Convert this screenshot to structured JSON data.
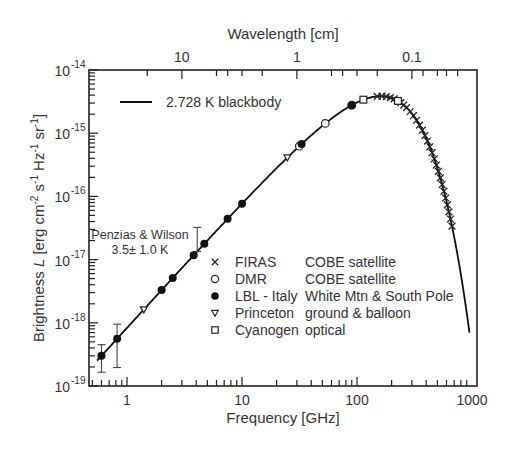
{
  "chart_data": {
    "type": "scatter",
    "title": "",
    "xlabel": "Frequency [GHz]",
    "x2label": "Wavelength [cm]",
    "ylabel": "Brightness L [erg cm^-2 s^-1 Hz^-1 sr^-1]",
    "xscale": "log",
    "yscale": "log",
    "xlim": [
      0.5,
      1000
    ],
    "ylim": [
      1e-19,
      1e-14
    ],
    "x_ticks": [
      {
        "value": 1,
        "label": "1"
      },
      {
        "value": 10,
        "label": "10"
      },
      {
        "value": 100,
        "label": "100"
      },
      {
        "value": 1000,
        "label": "1000"
      }
    ],
    "x2_ticks": [
      {
        "value_cm": 10,
        "label": "10"
      },
      {
        "value_cm": 1,
        "label": "1"
      },
      {
        "value_cm": 0.1,
        "label": "0.1"
      }
    ],
    "y_ticks": [
      {
        "exp": -14,
        "label": "10",
        "sup": "-14"
      },
      {
        "exp": -15,
        "label": "10",
        "sup": "-15"
      },
      {
        "exp": -16,
        "label": "10",
        "sup": "-16"
      },
      {
        "exp": -17,
        "label": "10",
        "sup": "-17"
      },
      {
        "exp": -18,
        "label": "10",
        "sup": "-18"
      },
      {
        "exp": -19,
        "label": "10",
        "sup": "-19"
      }
    ],
    "grid": false,
    "curve": {
      "name": "2.728 K blackbody",
      "temperature_K": 2.728,
      "x_range": [
        0.55,
        950
      ]
    },
    "series": [
      {
        "name": "FIRAS",
        "source": "COBE satellite",
        "marker": "x",
        "x": [
          150,
          165,
          180,
          195,
          210,
          225,
          240,
          255,
          270,
          290,
          310,
          330,
          350,
          370,
          390,
          410,
          430,
          450,
          470,
          490,
          510,
          530,
          550,
          570,
          590,
          610,
          630,
          650,
          670
        ]
      },
      {
        "name": "DMR",
        "source": "COBE satellite",
        "marker": "open-circle",
        "x": [
          31.5,
          53,
          90
        ]
      },
      {
        "name": "LBL - Italy",
        "source": "White Mtn & South Pole",
        "marker": "filled-circle",
        "x": [
          0.6,
          0.82,
          2.0,
          2.5,
          3.8,
          4.7,
          7.5,
          10,
          33,
          90
        ]
      },
      {
        "name": "Princeton",
        "source": "ground & balloon",
        "marker": "open-triangle-down",
        "x": [
          1.4,
          24.8
        ]
      },
      {
        "name": "Cyanogen",
        "source": "optical",
        "marker": "open-square",
        "x": [
          113.6,
          227
        ]
      }
    ],
    "error_bars": [
      {
        "x": 0.6,
        "low_factor": 0.55,
        "high_factor": 1.5
      },
      {
        "x": 0.82,
        "low_factor": 0.35,
        "high_factor": 1.7
      },
      {
        "x": 4.08,
        "low_factor": 1.0,
        "high_factor": 2.4,
        "note": "Penzias & Wilson"
      }
    ],
    "annotations": [
      {
        "text": "Penzias & Wilson",
        "x": 2.2,
        "y_exp": -16.85
      },
      {
        "text": "3.5± 1.0 K",
        "x": 2.2,
        "y_exp": -17.15
      }
    ],
    "legend": {
      "position": "upper-left",
      "line_label": "2.728 K blackbody",
      "markers_position": "center"
    }
  },
  "labels": {
    "top_axis_title": "Wavelength [cm]",
    "bottom_axis_title": "Frequency [GHz]",
    "y_axis_title_prefix": "Brightness ",
    "y_axis_title_var": "L",
    "y_axis_title_units": "[erg cm",
    "annotation_line1": "Penzias & Wilson",
    "annotation_line2": "3.5± 1.0 K",
    "legend_curve": "2.728 K blackbody"
  }
}
